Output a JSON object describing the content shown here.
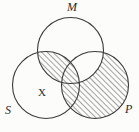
{
  "figure": {
    "type": "venn-diagram",
    "title": "",
    "background_color": "#fcfcfb",
    "stroke_color": "#3a3a3a",
    "hatch_color": "#4a4a4a",
    "circles": [
      {
        "id": "M",
        "label": "M",
        "cx": 70.5,
        "cy": 50.5,
        "r": 33.0,
        "filled": false
      },
      {
        "id": "S",
        "label": "S",
        "cx": 46.0,
        "cy": 85.0,
        "r": 33.5,
        "filled": false
      },
      {
        "id": "P",
        "label": "P",
        "cx": 95.0,
        "cy": 85.0,
        "r": 33.5,
        "filled": true
      }
    ],
    "labels": [
      {
        "id": "label-M",
        "text": "M",
        "for_circle": "M",
        "position": "top"
      },
      {
        "id": "label-S",
        "text": "S",
        "for_circle": "S",
        "position": "bottom-left"
      },
      {
        "id": "label-P",
        "text": "P",
        "for_circle": "P",
        "position": "bottom-right"
      }
    ],
    "region_marks": [
      {
        "id": "mark-X",
        "text": "X",
        "region": "S-only",
        "meaning": "existential-marker"
      }
    ],
    "shading": {
      "style": "diagonal-hatch",
      "direction": "forward-slash",
      "line_spacing_px": 4,
      "line_width_px": 1,
      "shaded_regions": [
        "P-only",
        "S-and-P-not-M",
        "M-and-P-and-S"
      ],
      "unshaded_regions": [
        "M-and-P-not-S",
        "S-only",
        "M-only",
        "S-and-M-not-P",
        "outside"
      ]
    }
  }
}
